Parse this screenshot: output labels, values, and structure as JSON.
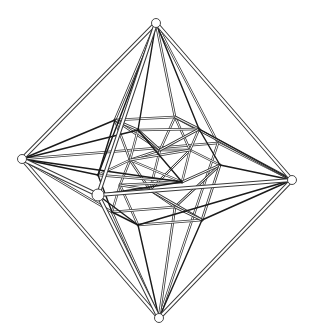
{
  "figure": {
    "title": "",
    "colors": {
      "background": "#ffffff",
      "line_dark": "#1a1a1a",
      "line_mid": "#555555",
      "line_light": "#b5b5b5"
    },
    "nodes": {
      "top": [
        156,
        23
      ],
      "left": [
        22,
        159
      ],
      "right": [
        292,
        180
      ],
      "bottom": [
        159,
        318
      ],
      "front": [
        98,
        195
      ],
      "back": [
        218,
        143
      ],
      "a": [
        115,
        120
      ],
      "b": [
        175,
        117
      ],
      "c": [
        199,
        129
      ],
      "d": [
        138,
        130
      ],
      "e": [
        98,
        175
      ],
      "f": [
        182,
        182
      ],
      "g": [
        220,
        165
      ],
      "h": [
        138,
        225
      ],
      "i": [
        202,
        220
      ],
      "j": [
        175,
        207
      ],
      "k": [
        112,
        212
      ],
      "l": [
        160,
        150
      ],
      "m": [
        130,
        160
      ],
      "n": [
        190,
        150
      ],
      "o": [
        150,
        190
      ],
      "p": [
        120,
        185
      ]
    },
    "outer_tubes": [
      [
        "top",
        "left"
      ],
      [
        "top",
        "right"
      ],
      [
        "bottom",
        "left"
      ],
      [
        "bottom",
        "right"
      ],
      [
        "top",
        "front"
      ],
      [
        "bottom",
        "front"
      ],
      [
        "front",
        "right"
      ],
      [
        "left",
        "front"
      ]
    ],
    "dark_edges": [
      [
        "top",
        "d"
      ],
      [
        "top",
        "c"
      ],
      [
        "top",
        "e"
      ],
      [
        "left",
        "a"
      ],
      [
        "left",
        "d"
      ],
      [
        "left",
        "f"
      ],
      [
        "left",
        "e"
      ],
      [
        "right",
        "c"
      ],
      [
        "right",
        "g"
      ],
      [
        "right",
        "h"
      ],
      [
        "right",
        "i"
      ],
      [
        "bottom",
        "h"
      ],
      [
        "bottom",
        "i"
      ],
      [
        "front",
        "h"
      ],
      [
        "d",
        "f"
      ],
      [
        "a",
        "e"
      ],
      [
        "c",
        "g"
      ],
      [
        "e",
        "k"
      ],
      [
        "k",
        "h"
      ],
      [
        "front",
        "f"
      ]
    ],
    "mid_edges": [
      [
        "top",
        "a"
      ],
      [
        "top",
        "b"
      ],
      [
        "left",
        "k"
      ],
      [
        "bottom",
        "k"
      ],
      [
        "bottom",
        "j"
      ],
      [
        "right",
        "b"
      ],
      [
        "a",
        "b"
      ],
      [
        "b",
        "c"
      ],
      [
        "d",
        "c"
      ],
      [
        "e",
        "f"
      ],
      [
        "g",
        "f"
      ],
      [
        "h",
        "i"
      ],
      [
        "i",
        "g"
      ],
      [
        "a",
        "d"
      ],
      [
        "d",
        "l"
      ],
      [
        "l",
        "c"
      ],
      [
        "m",
        "n"
      ],
      [
        "p",
        "o"
      ],
      [
        "o",
        "i"
      ],
      [
        "k",
        "j"
      ],
      [
        "j",
        "i"
      ]
    ],
    "light_edges": [
      [
        "back",
        "top"
      ],
      [
        "back",
        "left"
      ],
      [
        "back",
        "right"
      ],
      [
        "back",
        "bottom"
      ],
      [
        "a",
        "m"
      ],
      [
        "m",
        "p"
      ],
      [
        "p",
        "k"
      ],
      [
        "b",
        "n"
      ],
      [
        "n",
        "g"
      ],
      [
        "l",
        "m"
      ],
      [
        "l",
        "n"
      ],
      [
        "m",
        "o"
      ],
      [
        "n",
        "o"
      ],
      [
        "o",
        "j"
      ],
      [
        "p",
        "h"
      ],
      [
        "n",
        "f"
      ],
      [
        "l",
        "o"
      ],
      [
        "a",
        "l"
      ],
      [
        "b",
        "l"
      ],
      [
        "m",
        "e"
      ],
      [
        "g",
        "j"
      ],
      [
        "d",
        "m"
      ],
      [
        "c",
        "n"
      ],
      [
        "p",
        "f"
      ],
      [
        "m",
        "f"
      ]
    ],
    "visible_nodes": [
      "top",
      "left",
      "right",
      "bottom",
      "front"
    ]
  }
}
